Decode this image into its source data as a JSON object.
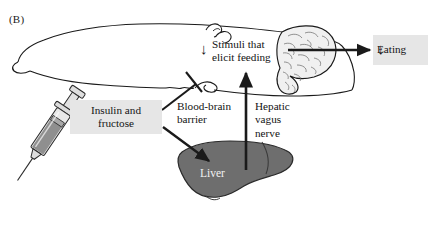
{
  "figure": {
    "panel_label": "(B)",
    "background_color": "#ffffff",
    "width": 442,
    "height": 232
  },
  "callouts": {
    "insulin": {
      "text": "Insulin and fructose",
      "line1": "Insulin and",
      "line2": "fructose",
      "box_color": "#e6e6e6"
    },
    "eating": {
      "text": "Eating",
      "arrow": "↓",
      "box_color": "#e6e6e6"
    }
  },
  "labels": {
    "stimuli": {
      "line1": "Stimuli that",
      "line2": "elicit feeding",
      "arrow": "↓"
    },
    "blood_brain_barrier": {
      "line1": "Blood-brain",
      "line2": "barrier"
    },
    "hepatic_vagus_nerve": {
      "line1": "Hepatic",
      "line2": "vagus",
      "line3": "nerve"
    },
    "liver": "Liver"
  },
  "anatomy": {
    "head_outline_color": "#1a1a1a",
    "brain_fill": "#f0f0f0",
    "liver_fill": "#6e6e6e",
    "liver_stroke": "#2a2a2a",
    "syringe_body": "#d9d9d9",
    "syringe_plunger": "#8a8a8a",
    "syringe_stroke": "#2a2a2a"
  },
  "connectors": {
    "brain_to_eating": {
      "type": "arrow",
      "direction": "right"
    },
    "liver_to_head": {
      "type": "arrow",
      "direction": "up"
    },
    "insulin_to_liver": {
      "type": "arrow",
      "direction": "down-right"
    },
    "insulin_to_brain": {
      "type": "blocked",
      "direction": "up-right"
    }
  }
}
